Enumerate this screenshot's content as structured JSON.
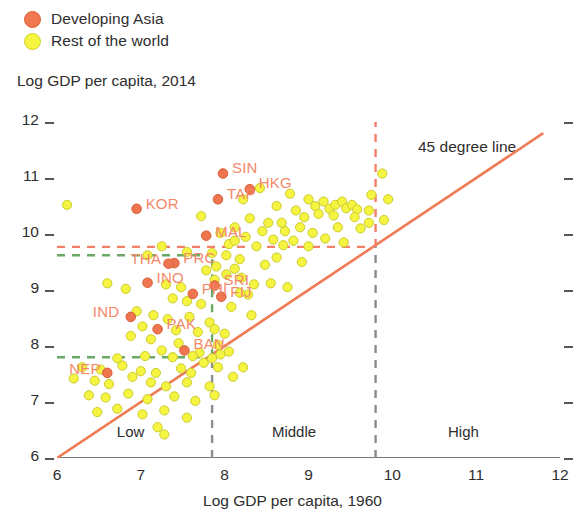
{
  "legend": {
    "items": [
      {
        "label": "Developing Asia",
        "color": "#f2784f",
        "icon": "circle-marker-icon"
      },
      {
        "label": "Rest of the world",
        "color": "#f4f441",
        "icon": "circle-marker-icon"
      }
    ]
  },
  "annotations": {
    "line45": "45 degree line",
    "categories": [
      {
        "label": "Low",
        "x": 7.0
      },
      {
        "label": "Middle",
        "x": 8.85
      },
      {
        "label": "High",
        "x": 10.95
      }
    ]
  },
  "chart_data": {
    "type": "scatter",
    "title": "",
    "xlabel": "Log GDP per capita, 1960",
    "ylabel": "Log GDP per capita, 2014",
    "xlim": [
      6,
      12
    ],
    "ylim": [
      6,
      12
    ],
    "xticks": [
      6,
      7,
      8,
      9,
      10,
      11,
      12
    ],
    "yticks": [
      6,
      7,
      8,
      9,
      10,
      11,
      12
    ],
    "grid": false,
    "legend_position": "top-left",
    "reference_lines": [
      {
        "name": "45-degree-line",
        "type": "diagonal",
        "from": [
          6,
          6
        ],
        "to": [
          11.8,
          11.8
        ],
        "color": "#ef7b55",
        "style": "solid"
      },
      {
        "name": "orange-threshold-vertical",
        "type": "vertical",
        "x": 9.8,
        "y_from": 9.77,
        "y_to": 12,
        "color": "#f4806a",
        "style": "dashed"
      },
      {
        "name": "orange-threshold-horizontal",
        "type": "horizontal",
        "y": 9.77,
        "x_from": 6,
        "x_to": 9.8,
        "color": "#f4806a",
        "style": "dashed"
      },
      {
        "name": "gray-high-divider",
        "type": "vertical",
        "x": 9.8,
        "y_from": 6,
        "y_to": 9.77,
        "color": "#8c8c8c",
        "style": "dashed"
      },
      {
        "name": "gray-low-divider",
        "type": "vertical",
        "x": 7.85,
        "y_from": 6,
        "y_to": 7.8,
        "color": "#8c8c8c",
        "style": "dashed"
      },
      {
        "name": "green-box-top",
        "type": "horizontal",
        "y": 9.62,
        "x_from": 6,
        "x_to": 7.85,
        "color": "#6aaa64",
        "style": "dashed"
      },
      {
        "name": "green-box-bottom",
        "type": "horizontal",
        "y": 7.8,
        "x_from": 6,
        "x_to": 7.85,
        "color": "#6aaa64",
        "style": "dashed"
      },
      {
        "name": "green-box-right",
        "type": "vertical",
        "x": 7.85,
        "y_from": 7.8,
        "y_to": 9.62,
        "color": "#6aaa64",
        "style": "dashed"
      }
    ],
    "series": [
      {
        "name": "Developing Asia",
        "color": "#ef7450",
        "points": [
          {
            "label": "SIN",
            "x": 7.98,
            "y": 11.08
          },
          {
            "label": "HKG",
            "x": 8.3,
            "y": 10.8
          },
          {
            "label": "TAP",
            "x": 7.92,
            "y": 10.62
          },
          {
            "label": "KOR",
            "x": 6.95,
            "y": 10.45
          },
          {
            "label": "MAL",
            "x": 7.78,
            "y": 9.97
          },
          {
            "label": "PRC",
            "x": 7.4,
            "y": 9.48
          },
          {
            "label": "THA",
            "x": 7.33,
            "y": 9.47
          },
          {
            "label": "INO",
            "x": 7.08,
            "y": 9.13
          },
          {
            "label": "PHI",
            "x": 7.62,
            "y": 8.93
          },
          {
            "label": "SRI",
            "x": 7.88,
            "y": 9.08
          },
          {
            "label": "FIJ",
            "x": 7.96,
            "y": 8.88
          },
          {
            "label": "IND",
            "x": 6.88,
            "y": 8.52
          },
          {
            "label": "PAK",
            "x": 7.2,
            "y": 8.3
          },
          {
            "label": "BAN",
            "x": 7.52,
            "y": 7.92
          },
          {
            "label": "NEP",
            "x": 6.6,
            "y": 7.52
          }
        ]
      },
      {
        "name": "Rest of the world",
        "color": "#f4f441",
        "points": [
          {
            "x": 6.12,
            "y": 10.52
          },
          {
            "x": 7.72,
            "y": 10.32
          },
          {
            "x": 8.22,
            "y": 10.62
          },
          {
            "x": 8.62,
            "y": 10.5
          },
          {
            "x": 8.78,
            "y": 10.72
          },
          {
            "x": 9.0,
            "y": 10.62
          },
          {
            "x": 9.08,
            "y": 10.5
          },
          {
            "x": 9.18,
            "y": 10.58
          },
          {
            "x": 9.25,
            "y": 10.45
          },
          {
            "x": 9.32,
            "y": 10.52
          },
          {
            "x": 9.4,
            "y": 10.58
          },
          {
            "x": 9.45,
            "y": 10.46
          },
          {
            "x": 9.52,
            "y": 10.52
          },
          {
            "x": 9.58,
            "y": 10.44
          },
          {
            "x": 9.12,
            "y": 10.36
          },
          {
            "x": 9.3,
            "y": 10.33
          },
          {
            "x": 9.55,
            "y": 10.3
          },
          {
            "x": 8.95,
            "y": 10.3
          },
          {
            "x": 9.72,
            "y": 10.42
          },
          {
            "x": 9.88,
            "y": 11.08
          },
          {
            "x": 9.95,
            "y": 10.62
          },
          {
            "x": 9.75,
            "y": 10.7
          },
          {
            "x": 9.72,
            "y": 10.2
          },
          {
            "x": 9.9,
            "y": 10.25
          },
          {
            "x": 8.42,
            "y": 10.82
          },
          {
            "x": 8.52,
            "y": 10.2
          },
          {
            "x": 8.3,
            "y": 10.28
          },
          {
            "x": 8.68,
            "y": 10.2
          },
          {
            "x": 8.12,
            "y": 10.12
          },
          {
            "x": 8.45,
            "y": 10.05
          },
          {
            "x": 8.72,
            "y": 10.05
          },
          {
            "x": 8.9,
            "y": 10.12
          },
          {
            "x": 9.05,
            "y": 10.02
          },
          {
            "x": 8.25,
            "y": 9.95
          },
          {
            "x": 8.58,
            "y": 9.9
          },
          {
            "x": 8.82,
            "y": 9.88
          },
          {
            "x": 9.2,
            "y": 9.92
          },
          {
            "x": 9.42,
            "y": 9.85
          },
          {
            "x": 8.05,
            "y": 9.82
          },
          {
            "x": 8.38,
            "y": 9.78
          },
          {
            "x": 8.7,
            "y": 9.8
          },
          {
            "x": 9.0,
            "y": 9.78
          },
          {
            "x": 7.25,
            "y": 9.78
          },
          {
            "x": 7.08,
            "y": 9.62
          },
          {
            "x": 7.55,
            "y": 9.68
          },
          {
            "x": 7.85,
            "y": 9.66
          },
          {
            "x": 8.02,
            "y": 9.62
          },
          {
            "x": 8.18,
            "y": 9.55
          },
          {
            "x": 7.9,
            "y": 9.42
          },
          {
            "x": 8.12,
            "y": 9.38
          },
          {
            "x": 7.78,
            "y": 9.35
          },
          {
            "x": 8.02,
            "y": 9.28
          },
          {
            "x": 8.2,
            "y": 9.22
          },
          {
            "x": 7.88,
            "y": 9.18
          },
          {
            "x": 6.6,
            "y": 9.12
          },
          {
            "x": 6.82,
            "y": 9.02
          },
          {
            "x": 7.3,
            "y": 9.1
          },
          {
            "x": 7.48,
            "y": 9.05
          },
          {
            "x": 8.35,
            "y": 9.1
          },
          {
            "x": 8.55,
            "y": 9.12
          },
          {
            "x": 8.75,
            "y": 9.05
          },
          {
            "x": 8.28,
            "y": 8.92
          },
          {
            "x": 7.38,
            "y": 8.85
          },
          {
            "x": 7.55,
            "y": 8.8
          },
          {
            "x": 7.72,
            "y": 8.75
          },
          {
            "x": 8.08,
            "y": 8.7
          },
          {
            "x": 6.95,
            "y": 8.62
          },
          {
            "x": 7.15,
            "y": 8.55
          },
          {
            "x": 7.32,
            "y": 8.48
          },
          {
            "x": 7.58,
            "y": 8.52
          },
          {
            "x": 7.82,
            "y": 8.42
          },
          {
            "x": 8.32,
            "y": 8.55
          },
          {
            "x": 7.02,
            "y": 8.35
          },
          {
            "x": 7.42,
            "y": 8.28
          },
          {
            "x": 7.68,
            "y": 8.25
          },
          {
            "x": 7.88,
            "y": 8.3
          },
          {
            "x": 8.0,
            "y": 8.22
          },
          {
            "x": 6.88,
            "y": 8.18
          },
          {
            "x": 7.12,
            "y": 8.12
          },
          {
            "x": 7.45,
            "y": 8.05
          },
          {
            "x": 7.92,
            "y": 8.02
          },
          {
            "x": 7.25,
            "y": 7.92
          },
          {
            "x": 7.7,
            "y": 7.88
          },
          {
            "x": 7.95,
            "y": 7.85
          },
          {
            "x": 6.72,
            "y": 7.78
          },
          {
            "x": 7.05,
            "y": 7.82
          },
          {
            "x": 7.38,
            "y": 7.8
          },
          {
            "x": 7.62,
            "y": 7.82
          },
          {
            "x": 7.85,
            "y": 7.78
          },
          {
            "x": 6.3,
            "y": 7.62
          },
          {
            "x": 6.52,
            "y": 7.58
          },
          {
            "x": 6.78,
            "y": 7.65
          },
          {
            "x": 7.0,
            "y": 7.55
          },
          {
            "x": 7.18,
            "y": 7.52
          },
          {
            "x": 7.48,
            "y": 7.6
          },
          {
            "x": 7.6,
            "y": 7.52
          },
          {
            "x": 7.75,
            "y": 7.7
          },
          {
            "x": 7.92,
            "y": 7.62
          },
          {
            "x": 8.05,
            "y": 7.9
          },
          {
            "x": 6.2,
            "y": 7.42
          },
          {
            "x": 6.45,
            "y": 7.38
          },
          {
            "x": 6.62,
            "y": 7.32
          },
          {
            "x": 6.9,
            "y": 7.45
          },
          {
            "x": 7.12,
            "y": 7.35
          },
          {
            "x": 7.3,
            "y": 7.28
          },
          {
            "x": 7.55,
            "y": 7.35
          },
          {
            "x": 7.82,
            "y": 7.28
          },
          {
            "x": 8.1,
            "y": 7.45
          },
          {
            "x": 8.22,
            "y": 7.62
          },
          {
            "x": 6.38,
            "y": 7.12
          },
          {
            "x": 6.58,
            "y": 7.08
          },
          {
            "x": 6.85,
            "y": 7.15
          },
          {
            "x": 7.08,
            "y": 7.05
          },
          {
            "x": 7.4,
            "y": 7.1
          },
          {
            "x": 7.65,
            "y": 7.02
          },
          {
            "x": 7.88,
            "y": 7.12
          },
          {
            "x": 6.48,
            "y": 6.82
          },
          {
            "x": 6.72,
            "y": 6.88
          },
          {
            "x": 7.02,
            "y": 6.78
          },
          {
            "x": 7.28,
            "y": 6.85
          },
          {
            "x": 7.55,
            "y": 6.72
          },
          {
            "x": 7.2,
            "y": 6.55
          },
          {
            "x": 7.28,
            "y": 6.42
          },
          {
            "x": 8.18,
            "y": 8.95
          },
          {
            "x": 8.48,
            "y": 9.45
          },
          {
            "x": 8.62,
            "y": 9.58
          },
          {
            "x": 9.62,
            "y": 10.1
          },
          {
            "x": 9.35,
            "y": 10.12
          },
          {
            "x": 8.92,
            "y": 9.5
          },
          {
            "x": 8.12,
            "y": 9.88
          },
          {
            "x": 7.95,
            "y": 10.02
          },
          {
            "x": 8.85,
            "y": 10.42
          }
        ]
      }
    ]
  }
}
